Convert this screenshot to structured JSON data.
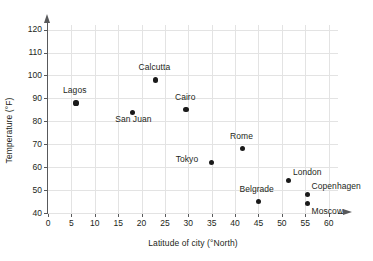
{
  "chart_data": {
    "type": "scatter",
    "title": "",
    "xlabel": "Latitude of city (°North)",
    "ylabel": "Temperature (°F)",
    "xlim": [
      0,
      62
    ],
    "ylim": [
      40,
      122
    ],
    "xticks": [
      0,
      5,
      10,
      15,
      20,
      25,
      30,
      35,
      40,
      45,
      50,
      55,
      60
    ],
    "yticks": [
      40,
      50,
      60,
      70,
      80,
      90,
      100,
      110,
      120
    ],
    "grid": true,
    "legend": "none",
    "points": [
      {
        "label": "Lagos",
        "x": 6,
        "y": 88,
        "label_dx": -13,
        "label_dy": -13
      },
      {
        "label": "San Juan",
        "x": 18,
        "y": 84,
        "label_dx": -17,
        "label_dy": 7
      },
      {
        "label": "Calcutta",
        "x": 23,
        "y": 98,
        "label_dx": -17,
        "label_dy": -13
      },
      {
        "label": "Cairo",
        "x": 29.5,
        "y": 85,
        "label_dx": -11,
        "label_dy": -13
      },
      {
        "label": "Tokyo",
        "x": 35,
        "y": 62,
        "label_dx": -36,
        "label_dy": -4
      },
      {
        "label": "Rome",
        "x": 41.5,
        "y": 68,
        "label_dx": -12,
        "label_dy": -13
      },
      {
        "label": "Belgrade",
        "x": 45,
        "y": 45,
        "label_dx": -19,
        "label_dy": -13
      },
      {
        "label": "London",
        "x": 51.5,
        "y": 54,
        "label_dx": 4,
        "label_dy": -9
      },
      {
        "label": "Copenhagen",
        "x": 55.5,
        "y": 48,
        "label_dx": 4,
        "label_dy": -9
      },
      {
        "label": "Moscow",
        "x": 55.5,
        "y": 44,
        "label_dx": 4,
        "label_dy": 7
      }
    ]
  },
  "colors": {
    "point": "#1a1a1a",
    "axis": "#58595b",
    "grid": "#e3e3e3",
    "text": "#231f20",
    "background": "#ffffff"
  }
}
